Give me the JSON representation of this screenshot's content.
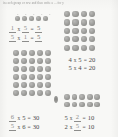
{
  "document": {
    "type": "math-worksheet-scan",
    "instruction_line": "in each group or row and then write a ... for y"
  },
  "colors": {
    "page_background": "#f8f8f6",
    "dot_fill": "#9c9c99",
    "text": "#4b4b4b",
    "blank_rule": "#8d8d8b"
  },
  "groups": [
    {
      "id": "group-1",
      "name": "one-row-of-five",
      "array": {
        "rows": 1,
        "cols": 5,
        "total": 5
      },
      "dot_labels": [
        "5",
        "5",
        "5",
        "5",
        "5"
      ],
      "equations": [
        {
          "a": "1",
          "b": "5",
          "product": "5"
        },
        {
          "a": "5",
          "b": "1",
          "product": "5"
        }
      ]
    },
    {
      "id": "group-2",
      "name": "five-rows-of-four",
      "array": {
        "rows": 5,
        "cols": 4,
        "total": 20
      },
      "equations": [
        {
          "a": "4",
          "b": "5",
          "product": "20"
        },
        {
          "a": "5",
          "b": "4",
          "product": "20"
        }
      ]
    },
    {
      "id": "group-3",
      "name": "six-rows-of-five",
      "array": {
        "rows": 6,
        "cols": 5,
        "total": 30
      },
      "equations": [
        {
          "a": "6",
          "b": "5",
          "product": "30"
        },
        {
          "a": "5",
          "b": "6",
          "product": "30"
        }
      ]
    },
    {
      "id": "group-4",
      "name": "two-rows-of-five",
      "array": {
        "rows": 2,
        "cols": 5,
        "total": 10
      },
      "equations": [
        {
          "a": "5",
          "b": "2",
          "product": "10"
        },
        {
          "a": "2",
          "b": "5",
          "product": "10"
        }
      ]
    }
  ],
  "symbols": {
    "times": "x",
    "equals": "="
  }
}
